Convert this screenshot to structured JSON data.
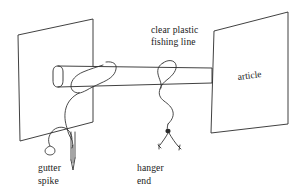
{
  "figure": {
    "kind": "line-drawing-diagram",
    "background_color": "#ffffff",
    "ink_color": "#2b2b2b"
  },
  "labels": {
    "fishing_line_line1": "clear plastic",
    "fishing_line_line2": "fishing line",
    "gutter_spike_line1": "gutter",
    "gutter_spike_line2": "spike",
    "hanger_end_line1": "hanger",
    "hanger_end_line2": "end",
    "article": "article"
  },
  "parts": {
    "left_panel_name": "wall-panel",
    "right_panel_name": "article-panel",
    "rod_name": "horizontal-rod",
    "spike_name": "gutter-spike",
    "hanger_name": "hanger-end-knot",
    "line_name": "fishing-line"
  }
}
